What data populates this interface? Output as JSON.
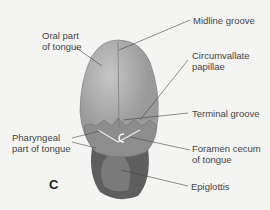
{
  "figure": {
    "panel_letter": "C",
    "labels": {
      "oral_part_line1": "Oral part",
      "oral_part_line2": "of tongue",
      "midline_groove": "Midline groove",
      "circumvallate_line1": "Circumvallate",
      "circumvallate_line2": "papillae",
      "terminal_groove": "Terminal groove",
      "pharyngeal_line1": "Pharyngeal",
      "pharyngeal_line2": "part of tongue",
      "foramen_line1": "Foramen cecum",
      "foramen_line2": "of tongue",
      "epiglottis": "Epiglottis"
    },
    "colors": {
      "background": "#f4f4f2",
      "tongue": "#9a9a9a",
      "tongue_highlight": "#bdbdbd",
      "pharynx": "#6c6c6c",
      "leader_lines": "#444444"
    }
  }
}
